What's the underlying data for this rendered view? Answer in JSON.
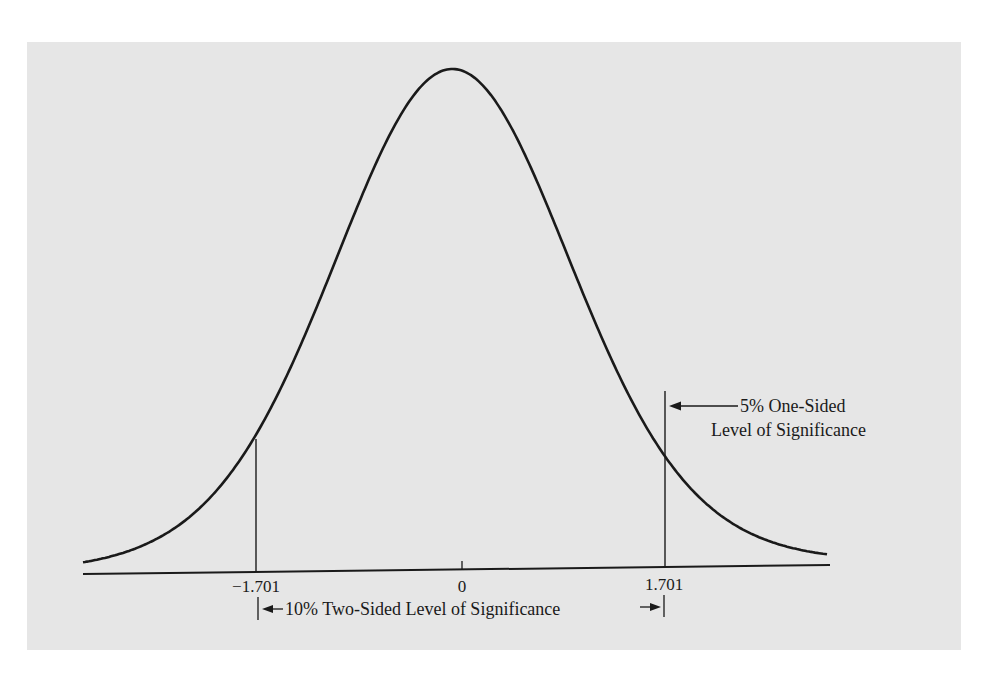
{
  "chart_data": {
    "type": "line",
    "title": "",
    "xlabel": "",
    "ylabel": "",
    "x_ticks": [
      {
        "value": -1.701,
        "label": "−1.701"
      },
      {
        "value": 0,
        "label": "0"
      },
      {
        "value": 1.701,
        "label": "1.701"
      }
    ],
    "critical_values": [
      -1.701,
      1.701
    ],
    "annotations": {
      "one_sided_line1": "5% One-Sided",
      "one_sided_line2": "Level of Significance",
      "two_sided": "10% Two-Sided Level of Significance"
    },
    "grid": false,
    "legend": null,
    "colors": {
      "background": "#e6e6e6",
      "ink": "#1a1a1a"
    }
  }
}
